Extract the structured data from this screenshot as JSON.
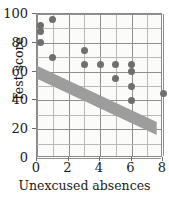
{
  "chart_data": {
    "type": "scatter",
    "title": "",
    "xlabel": "Unexcused absences",
    "ylabel": "Test score",
    "xlim": [
      0,
      8
    ],
    "ylim": [
      0,
      100
    ],
    "xticks": [
      0,
      2,
      4,
      6,
      8
    ],
    "yticks": [
      0,
      20,
      40,
      60,
      80,
      100
    ],
    "xtick_labels": [
      "0",
      "2",
      "4",
      "6",
      "8"
    ],
    "ytick_labels": [
      "0",
      "20",
      "40",
      "60",
      "80",
      "100"
    ],
    "x_minor_step": 1,
    "y_minor_step": 10,
    "grid": true,
    "legend": null,
    "marker_color": "#6f6f6f",
    "band_color": "#9d9d9d",
    "points": [
      {
        "x": 0.2,
        "y": 92
      },
      {
        "x": 0.2,
        "y": 88
      },
      {
        "x": 0.2,
        "y": 80
      },
      {
        "x": 1.0,
        "y": 96
      },
      {
        "x": 1.0,
        "y": 70
      },
      {
        "x": 3.0,
        "y": 75
      },
      {
        "x": 3.0,
        "y": 65
      },
      {
        "x": 4.0,
        "y": 65
      },
      {
        "x": 5.0,
        "y": 65
      },
      {
        "x": 5.0,
        "y": 55
      },
      {
        "x": 6.0,
        "y": 65
      },
      {
        "x": 6.0,
        "y": 60
      },
      {
        "x": 6.0,
        "y": 50
      },
      {
        "x": 6.0,
        "y": 40
      },
      {
        "x": 8.0,
        "y": 45
      }
    ],
    "trend_band": {
      "description": "shaded diagonal band indicating negative association",
      "upper_line": [
        {
          "x": 0.0,
          "y": 64
        },
        {
          "x": 7.6,
          "y": 25
        }
      ],
      "lower_line": [
        {
          "x": 0.0,
          "y": 55
        },
        {
          "x": 7.6,
          "y": 16
        }
      ]
    }
  }
}
